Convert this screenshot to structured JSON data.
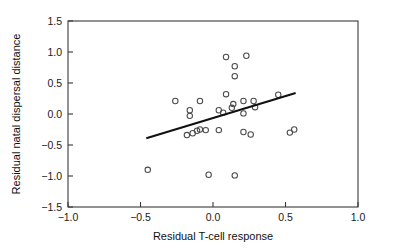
{
  "chart_data": {
    "type": "scatter",
    "title": "",
    "xlabel": "Residual T-cell response",
    "ylabel": "Residual natal dispersal distance",
    "xlim": [
      -1.0,
      1.0
    ],
    "ylim": [
      -1.5,
      1.5
    ],
    "xticks": [
      -1.0,
      -0.5,
      0.0,
      0.5,
      1.0
    ],
    "yticks": [
      -1.5,
      -1.0,
      -0.5,
      0.0,
      0.5,
      1.0,
      1.5
    ],
    "xtick_labels": [
      "−1.0",
      "−0.5",
      "0.0",
      "0.5",
      "1.0"
    ],
    "ytick_labels": [
      "−1.5",
      "−1.0",
      "−0.5",
      "0.0",
      "0.5",
      "1.0",
      "1.5"
    ],
    "grid": false,
    "legend": false,
    "marker": "open-circle",
    "marker_color": "#4a4a4a",
    "points": [
      {
        "x": 0.09,
        "y": 0.92
      },
      {
        "x": 0.23,
        "y": 0.94
      },
      {
        "x": 0.15,
        "y": 0.77
      },
      {
        "x": 0.15,
        "y": 0.61
      },
      {
        "x": 0.09,
        "y": 0.32
      },
      {
        "x": -0.26,
        "y": 0.21
      },
      {
        "x": -0.09,
        "y": 0.21
      },
      {
        "x": 0.14,
        "y": 0.16
      },
      {
        "x": 0.13,
        "y": 0.1
      },
      {
        "x": 0.04,
        "y": 0.06
      },
      {
        "x": -0.16,
        "y": 0.06
      },
      {
        "x": 0.21,
        "y": 0.21
      },
      {
        "x": 0.28,
        "y": 0.21
      },
      {
        "x": 0.45,
        "y": 0.31
      },
      {
        "x": 0.29,
        "y": 0.11
      },
      {
        "x": -0.16,
        "y": -0.03
      },
      {
        "x": 0.21,
        "y": 0.01
      },
      {
        "x": 0.07,
        "y": 0.02
      },
      {
        "x": -0.18,
        "y": -0.34
      },
      {
        "x": -0.14,
        "y": -0.31
      },
      {
        "x": -0.11,
        "y": -0.27
      },
      {
        "x": -0.09,
        "y": -0.25
      },
      {
        "x": -0.05,
        "y": -0.26
      },
      {
        "x": 0.04,
        "y": -0.26
      },
      {
        "x": 0.21,
        "y": -0.29
      },
      {
        "x": 0.26,
        "y": -0.33
      },
      {
        "x": 0.53,
        "y": -0.3
      },
      {
        "x": 0.56,
        "y": -0.25
      },
      {
        "x": -0.45,
        "y": -0.9
      },
      {
        "x": -0.03,
        "y": -0.98
      },
      {
        "x": 0.15,
        "y": -0.99
      }
    ],
    "fit_line": {
      "label": "regression-line",
      "x_start": -0.46,
      "y_start": -0.39,
      "x_end": 0.57,
      "y_end": 0.34,
      "color": "#111111"
    }
  }
}
